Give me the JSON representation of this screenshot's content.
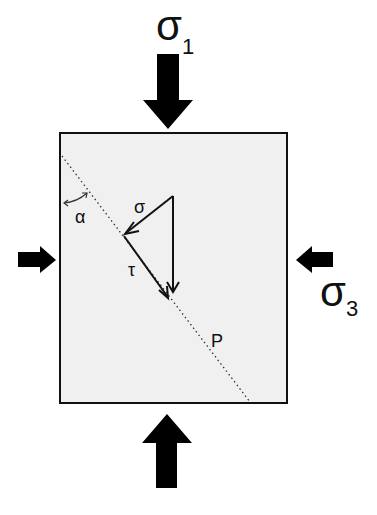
{
  "diagram": {
    "labels": {
      "sigma1": "σ",
      "sigma1_sub": "1",
      "sigma3": "σ",
      "sigma3_sub": "3",
      "normal_stress": "σ",
      "shear_stress": "τ",
      "angle": "α",
      "plane": "P"
    },
    "colors": {
      "box_fill": "#f0f0f0",
      "stroke": "#111111",
      "arrow": "#000000"
    }
  }
}
